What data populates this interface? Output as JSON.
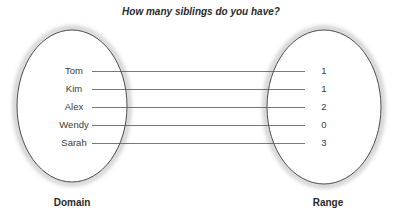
{
  "title": "How many siblings do you have?",
  "domain": {
    "label": "Domain",
    "items": [
      "Tom",
      "Kim",
      "Alex",
      "Wendy",
      "Sarah"
    ]
  },
  "range": {
    "label": "Range",
    "items": [
      "1",
      "1",
      "2",
      "0",
      "3"
    ]
  },
  "mappings": [
    {
      "from": "Tom",
      "to": "1"
    },
    {
      "from": "Kim",
      "to": "1"
    },
    {
      "from": "Alex",
      "to": "2"
    },
    {
      "from": "Wendy",
      "to": "0"
    },
    {
      "from": "Sarah",
      "to": "3"
    }
  ],
  "colors": {
    "ellipse_stroke": "#4a4a4a",
    "ellipse_shadow": "#bdbdbd",
    "connector": "#555555",
    "text": "#333333"
  }
}
